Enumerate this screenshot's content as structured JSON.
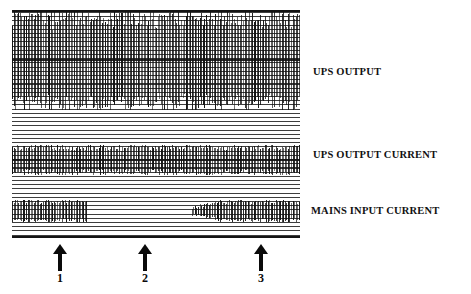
{
  "figure": {
    "type": "chart-recorder-strip",
    "background": "#ffffff",
    "ink_color": "#111111"
  },
  "traces": [
    {
      "id": "ups-output",
      "label": "UPS OUTPUT",
      "band_top": 0,
      "band_height": 100,
      "description": "continuous high-amplitude AC waveform envelope, uninterrupted across entire record",
      "active_from_pct": 0,
      "active_to_pct": 100,
      "amplitude_pct": 100
    },
    {
      "id": "ups-output-current",
      "label": "UPS OUTPUT CURRENT",
      "band_top": 135,
      "band_height": 30,
      "description": "continuous current envelope, uninterrupted across entire record",
      "active_from_pct": 0,
      "active_to_pct": 100,
      "amplitude_pct": 100
    },
    {
      "id": "mains-input-current",
      "label": "MAINS INPUT CURRENT",
      "band_top": 190,
      "band_height": 22,
      "description": "current present at start, ceases at event 1, absent through event 2, restarts and ramps back to full amplitude after event 3",
      "segments": [
        {
          "from_pct": 0,
          "to_pct": 26,
          "amplitude_pct": 100
        },
        {
          "from_pct": 26,
          "to_pct": 62,
          "amplitude_pct": 0
        },
        {
          "from_pct": 62,
          "to_pct": 72,
          "amplitude_pct": 35
        },
        {
          "from_pct": 72,
          "to_pct": 100,
          "amplitude_pct": 100
        }
      ]
    }
  ],
  "markers": [
    {
      "id": "marker-1",
      "label": "1",
      "x_pct": 17
    },
    {
      "id": "marker-2",
      "label": "2",
      "x_pct": 46
    },
    {
      "id": "marker-3",
      "label": "3",
      "x_pct": 86
    }
  ],
  "chart_data": {
    "type": "line",
    "title": "",
    "xlabel": "",
    "ylabel": "",
    "grid": true,
    "legend_position": "right",
    "series": [
      {
        "name": "UPS OUTPUT",
        "envelope": [
          100,
          100,
          100,
          100,
          100,
          100,
          100,
          100,
          100,
          100
        ]
      },
      {
        "name": "UPS OUTPUT CURRENT",
        "envelope": [
          100,
          100,
          100,
          100,
          100,
          100,
          100,
          100,
          100,
          100
        ]
      },
      {
        "name": "MAINS INPUT CURRENT",
        "envelope": [
          100,
          100,
          0,
          0,
          0,
          0,
          20,
          60,
          100,
          100
        ]
      }
    ],
    "annotations": [
      {
        "label": "1",
        "x_pct": 17
      },
      {
        "label": "2",
        "x_pct": 46
      },
      {
        "label": "3",
        "x_pct": 86
      }
    ]
  }
}
